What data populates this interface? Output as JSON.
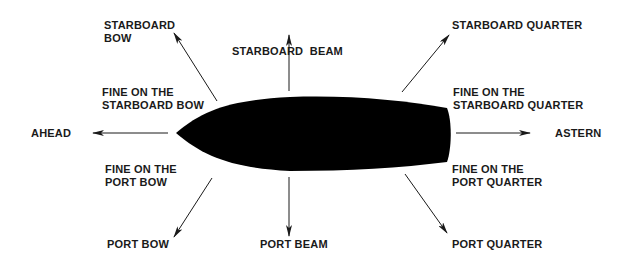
{
  "diagram": {
    "hull_color": "#000000",
    "arrow_color": "#1a1a1a",
    "labels": {
      "starboard_bow": [
        "STARBOARD",
        "BOW"
      ],
      "starboard_beam": [
        "STARBOARD  BEAM"
      ],
      "starboard_quarter": [
        "STARBOARD QUARTER"
      ],
      "fine_starboard_bow": [
        "FINE ON THE",
        "STARBOARD BOW"
      ],
      "fine_starboard_quarter": [
        "FINE ON THE",
        "STARBOARD QUARTER"
      ],
      "ahead": [
        "AHEAD"
      ],
      "astern": [
        "ASTERN"
      ],
      "fine_port_bow": [
        "FINE ON THE",
        "PORT BOW"
      ],
      "fine_port_quarter": [
        "FINE ON THE",
        "PORT QUARTER"
      ],
      "port_bow": [
        "PORT BOW"
      ],
      "port_beam": [
        "PORT BEAM"
      ],
      "port_quarter": [
        "PORT QUARTER"
      ]
    }
  }
}
